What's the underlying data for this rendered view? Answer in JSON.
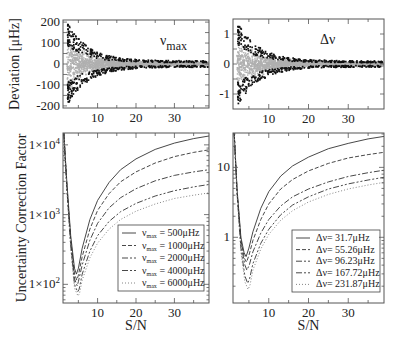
{
  "figure": {
    "ylabel_top": "Deviation [μHz]",
    "ylabel_bottom": "Uncertainty Correction Factor",
    "xlabel": "S/N"
  },
  "chart_data": [
    {
      "id": "numax-deviation",
      "type": "scatter",
      "title": "ν max",
      "annotation": {
        "main": "ν",
        "sub": "max"
      },
      "xlabel": "",
      "ylabel": "Deviation [μHz]",
      "xlim": [
        1,
        39
      ],
      "ylim": [
        -210,
        210
      ],
      "xticks": [
        10,
        20,
        30
      ],
      "yticks": [
        -200,
        -100,
        0,
        100,
        200
      ],
      "ytick_labels": [
        "-200",
        "-100",
        "0",
        "100",
        "200"
      ],
      "envelope": {
        "description": "scatter of deviations vs S/N; spread ~±200 at S/N~2-4 narrowing to ~±15 at S/N~38",
        "amp_at_low_sn": 200,
        "amp_at_high_sn": 15
      },
      "colors": {
        "dense": "#b0b0b0",
        "outliers": "#111111"
      }
    },
    {
      "id": "dnu-deviation",
      "type": "scatter",
      "title": "Δν",
      "annotation": {
        "main": "Δν",
        "sub": ""
      },
      "xlabel": "",
      "ylabel": "",
      "xlim": [
        1,
        39
      ],
      "ylim": [
        -1.5,
        1.5
      ],
      "xticks": [
        10,
        20,
        30
      ],
      "yticks": [
        -1,
        0,
        1
      ],
      "ytick_labels": [
        "-1",
        "0",
        "1"
      ],
      "envelope": {
        "description": "scatter of deviations vs S/N; spread ~±1.4 at S/N~2-4 narrowing to ~±0.1 at S/N~38",
        "amp_at_low_sn": 1.4,
        "amp_at_high_sn": 0.1
      },
      "colors": {
        "dense": "#b0b0b0",
        "outliers": "#111111"
      }
    },
    {
      "id": "numax-correction",
      "type": "line",
      "yscale": "log",
      "xlabel": "S/N",
      "ylabel": "Uncertainty Correction Factor",
      "xlim": [
        1,
        39
      ],
      "ylim": [
        54,
        14800
      ],
      "xticks": [
        10,
        20,
        30
      ],
      "yticks": [
        100,
        1000,
        10000
      ],
      "ytick_labels": [
        {
          "base": "1×10",
          "exp": "2"
        },
        {
          "base": "1×10",
          "exp": "3"
        },
        {
          "base": "1×10",
          "exp": "4"
        }
      ],
      "legend_position": "lower right",
      "series": [
        {
          "name": "νmax = 500μHz",
          "label_main": "ν",
          "label_sub": "max",
          "label_rest": " = 500μHz",
          "dash": "",
          "x": [
            1.2,
            2,
            3,
            4,
            4.5,
            5,
            6,
            8,
            10,
            13,
            16,
            20,
            25,
            30,
            35,
            39
          ],
          "values": [
            14800,
            3000,
            500,
            170,
            140,
            170,
            330,
            850,
            1600,
            2900,
            4400,
            6300,
            8600,
            10600,
            12300,
            13400
          ]
        },
        {
          "name": "νmax = 1000μHz",
          "label_main": "ν",
          "label_sub": "max",
          "label_rest": " = 1000μHz",
          "dash": "4,2",
          "x": [
            1.2,
            2,
            3,
            4,
            4.6,
            5,
            6,
            8,
            10,
            13,
            16,
            20,
            25,
            30,
            35,
            39
          ],
          "values": [
            14800,
            2800,
            440,
            140,
            115,
            135,
            250,
            620,
            1150,
            2000,
            2950,
            4100,
            5500,
            6800,
            7800,
            8500
          ]
        },
        {
          "name": "νmax = 2000μHz",
          "label_main": "ν",
          "label_sub": "max",
          "label_rest": " = 2000μHz",
          "dash": "6,2,2,2",
          "x": [
            1.2,
            2,
            3,
            4,
            4.7,
            5,
            6,
            8,
            10,
            13,
            16,
            20,
            25,
            30,
            35,
            39
          ],
          "values": [
            14800,
            2600,
            400,
            120,
            95,
            110,
            190,
            430,
            750,
            1250,
            1750,
            2350,
            3050,
            3650,
            4100,
            4400
          ]
        },
        {
          "name": "νmax = 4000μHz",
          "label_main": "ν",
          "label_sub": "max",
          "label_rest": " = 4000μHz",
          "dash": "6,2,2,2,2,2",
          "x": [
            1.2,
            2,
            3,
            4,
            4.8,
            5.2,
            6,
            8,
            10,
            13,
            16,
            20,
            25,
            30,
            35,
            39
          ],
          "values": [
            14800,
            2400,
            360,
            100,
            78,
            85,
            140,
            300,
            500,
            800,
            1100,
            1450,
            1850,
            2200,
            2500,
            2700
          ]
        },
        {
          "name": "νmax = 6000μHz",
          "label_main": "ν",
          "label_sub": "max",
          "label_rest": " = 6000μHz",
          "dash": "1,2",
          "x": [
            1.2,
            2,
            3,
            4,
            4.9,
            5.3,
            6,
            8,
            10,
            13,
            16,
            20,
            25,
            30,
            35,
            39
          ],
          "values": [
            14800,
            2300,
            330,
            88,
            68,
            74,
            115,
            240,
            390,
            620,
            850,
            1120,
            1420,
            1700,
            1900,
            2050
          ]
        }
      ]
    },
    {
      "id": "dnu-correction",
      "type": "line",
      "yscale": "log",
      "xlabel": "S/N",
      "ylabel": "",
      "xlim": [
        1,
        39
      ],
      "ylim": [
        0.115,
        31
      ],
      "xticks": [
        10,
        20,
        30
      ],
      "yticks": [
        1,
        10
      ],
      "ytick_labels": [
        "1",
        "10"
      ],
      "legend_position": "lower right",
      "series": [
        {
          "name": "Δν= 31.7μHz",
          "label_main": "Δν= 31.7μHz",
          "label_sub": "",
          "label_rest": "",
          "dash": "",
          "x": [
            1.3,
            2,
            3,
            3.8,
            4.3,
            5,
            6,
            8,
            10,
            13,
            16,
            20,
            25,
            30,
            35,
            39
          ],
          "values": [
            31,
            5,
            1.0,
            0.6,
            0.53,
            0.7,
            1.2,
            2.6,
            4.5,
            7.5,
            10.5,
            14,
            18.5,
            22,
            25.5,
            27.7
          ]
        },
        {
          "name": "Δν= 55.26μHz",
          "label_main": "Δν= 55.26μHz",
          "label_sub": "",
          "label_rest": "",
          "dash": "4,2",
          "x": [
            1.3,
            2,
            3,
            3.9,
            4.4,
            5,
            6,
            8,
            10,
            13,
            16,
            20,
            25,
            30,
            35,
            39
          ],
          "values": [
            31,
            4.8,
            0.9,
            0.5,
            0.44,
            0.55,
            0.9,
            1.8,
            3.0,
            4.9,
            6.7,
            8.9,
            11.4,
            13.6,
            15.2,
            16.4
          ]
        },
        {
          "name": "Δν= 96.23μHz",
          "label_main": "Δν= 96.23μHz",
          "label_sub": "",
          "label_rest": "",
          "dash": "6,2,2,2",
          "x": [
            1.3,
            2,
            3,
            4,
            4.5,
            5.1,
            6,
            8,
            10,
            13,
            16,
            20,
            25,
            30,
            35,
            39
          ],
          "values": [
            31,
            4.6,
            0.8,
            0.4,
            0.34,
            0.4,
            0.62,
            1.15,
            1.8,
            2.8,
            3.8,
            4.9,
            6.2,
            7.4,
            8.4,
            9.1
          ]
        },
        {
          "name": "Δν= 167.72μHz",
          "label_main": "Δν= 167.72μHz",
          "label_sub": "",
          "label_rest": "",
          "dash": "6,2,2,2,2,2",
          "x": [
            1.3,
            2,
            3,
            4,
            4.7,
            5.2,
            6,
            8,
            10,
            13,
            16,
            20,
            25,
            30,
            35,
            39
          ],
          "values": [
            31,
            4.4,
            0.7,
            0.28,
            0.22,
            0.26,
            0.42,
            0.82,
            1.3,
            2.1,
            2.9,
            3.8,
            4.9,
            5.8,
            6.6,
            7.2
          ]
        },
        {
          "name": "Δν= 231.87μHz",
          "label_main": "Δν= 231.87μHz",
          "label_sub": "",
          "label_rest": "",
          "dash": "1,2",
          "x": [
            1.3,
            2,
            3,
            4,
            4.8,
            5.3,
            6,
            8,
            10,
            13,
            16,
            20,
            25,
            30,
            35,
            39
          ],
          "values": [
            31,
            4.2,
            0.62,
            0.23,
            0.18,
            0.21,
            0.34,
            0.68,
            1.1,
            1.75,
            2.4,
            3.2,
            4.1,
            4.9,
            5.6,
            6.1
          ]
        }
      ]
    }
  ]
}
